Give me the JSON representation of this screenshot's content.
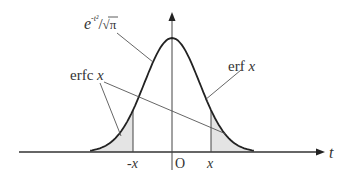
{
  "diagram": {
    "type": "gaussian-error-function-illustration",
    "labels": {
      "density_base": "e",
      "density_exponent": "-t²",
      "density_denominator": "√π",
      "density_full": "e^{-t²}/√π",
      "erf": "erf",
      "erf_var": "x",
      "erfc": "erfc",
      "erfc_var": "x",
      "axis_t": "t",
      "origin": "O",
      "neg_x": "-x",
      "pos_x": "x"
    },
    "geometry": {
      "origin_px": [
        172,
        152
      ],
      "peak_px": [
        172,
        38
      ],
      "unit_px": 39,
      "x_marker_t": 1
    },
    "colors": {
      "curve": "#222222",
      "axis": "#333333",
      "leader": "#555555",
      "shade": "#e4e4e4",
      "text": "#333333"
    }
  }
}
